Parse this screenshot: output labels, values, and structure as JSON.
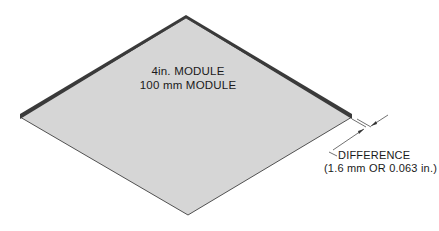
{
  "diagram": {
    "module_label_line1": "4in. MODULE",
    "module_label_line2": "100 mm MODULE",
    "difference_label": "DIFFERENCE",
    "difference_value": "(1.6 mm OR 0.063 in.)",
    "colors": {
      "panel_fill": "#d6d6d6",
      "edge_dark": "#3a3a3a",
      "outline": "#2a2a2a",
      "background": "#ffffff"
    }
  }
}
